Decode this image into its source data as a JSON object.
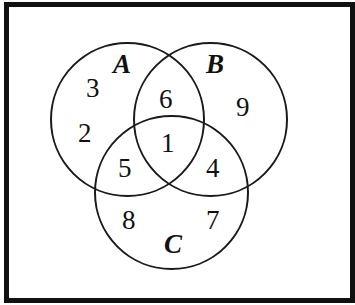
{
  "diagram": {
    "type": "venn",
    "sets": [
      {
        "name": "A",
        "label": "A"
      },
      {
        "name": "B",
        "label": "B"
      },
      {
        "name": "C",
        "label": "C"
      }
    ],
    "regions": {
      "A_only": [
        "3",
        "2"
      ],
      "B_only": [
        "9"
      ],
      "C_only": [
        "8",
        "7"
      ],
      "A_and_B_only": [
        "6"
      ],
      "A_and_C_only": [
        "5"
      ],
      "B_and_C_only": [
        "4"
      ],
      "A_and_B_and_C": [
        "1"
      ]
    },
    "labels": {
      "a": "A",
      "b": "B",
      "c": "C"
    },
    "numbers": {
      "n3": "3",
      "n2": "2",
      "n6": "6",
      "n9": "9",
      "n1": "1",
      "n5": "5",
      "n4": "4",
      "n8": "8",
      "n7": "7"
    },
    "colors": {
      "stroke": "#1a1a1a",
      "background": "#ffffff",
      "frame": "#111111"
    }
  }
}
